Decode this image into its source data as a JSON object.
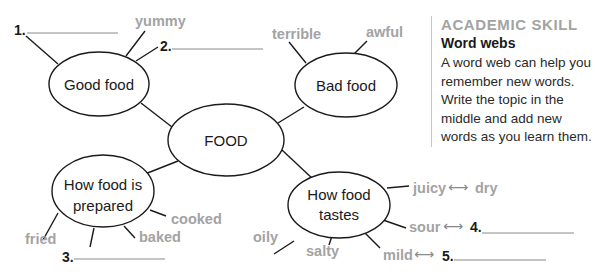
{
  "web": {
    "center": {
      "label": "FOOD"
    },
    "nodes": {
      "good_food": {
        "label": "Good food"
      },
      "bad_food": {
        "label": "Bad food"
      },
      "prepared": {
        "line1": "How food is",
        "line2": "prepared"
      },
      "tastes": {
        "line1": "How food",
        "line2": "tastes"
      }
    },
    "words": {
      "good_food": {
        "yummy": "yummy",
        "blank1_num": "1.",
        "blank2_num": "2."
      },
      "bad_food": {
        "terrible": "terrible",
        "awful": "awful"
      },
      "prepared": {
        "fried": "fried",
        "cooked": "cooked",
        "baked": "baked",
        "blank3_num": "3."
      },
      "tastes": {
        "juicy": "juicy",
        "dry": "dry",
        "sour": "sour",
        "blank4_num": "4.",
        "mild": "mild",
        "blank5_num": "5.",
        "oily": "oily",
        "salty": "salty",
        "arrow": "⟷"
      }
    }
  },
  "sidebar": {
    "kicker": "ACADEMIC SKILL",
    "title": "Word webs",
    "body": "A word web can help you remember new words. Write the topic in the middle and add new words as you learn them."
  }
}
